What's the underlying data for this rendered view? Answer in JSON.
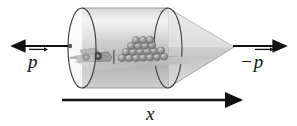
{
  "figure": {
    "background_color": "#ffffff",
    "width": 297,
    "height": 126
  },
  "labels": {
    "momentum_left": "p",
    "momentum_right_sign": "−",
    "momentum_right": "p",
    "axis_x": "x"
  },
  "arrows": {
    "left_momentum": {
      "name": "left-momentum-arrow",
      "direction": "left",
      "x_start": 70,
      "x_end": 8,
      "y": 46,
      "color": "#111111"
    },
    "right_momentum": {
      "name": "right-momentum-arrow",
      "direction": "right",
      "x_start": 232,
      "x_end": 290,
      "y": 46,
      "color": "#111111"
    },
    "x_axis": {
      "name": "x-axis-arrow",
      "direction": "right",
      "x_start": 62,
      "x_end": 246,
      "y": 100,
      "color": "#111111"
    }
  },
  "scene": {
    "cylinder": {
      "name": "cylinder-body",
      "left_center_x": 82,
      "right_center_x": 168,
      "center_y": 48,
      "radius_y": 40,
      "radius_x": 14,
      "fill_light": "#f2f2f2",
      "fill_mid": "#d0d0d0",
      "fill_dark": "#a8a8a8",
      "stroke": "#4a4a4a"
    },
    "cone": {
      "name": "cone-body",
      "base_x": 168,
      "tip_x": 234,
      "center_y": 48,
      "fill_light": "#efefef",
      "fill_dark": "#c4c4c4",
      "stroke": "#6d6d6d"
    },
    "ground_plane": {
      "name": "ground-plane",
      "fill": "#bdbdbd"
    },
    "cart": {
      "name": "cart-object",
      "x": 74,
      "y": 44,
      "width": 36,
      "height": 16,
      "body_color": "#8c8c8c",
      "wheel_color": "#4d4d4d"
    },
    "sphere_pile": {
      "name": "sphere-pile",
      "x": 118,
      "y": 40,
      "rows": [
        {
          "count": 9,
          "y": 57,
          "r": 3.6
        },
        {
          "count": 8,
          "y": 50,
          "r": 3.6
        },
        {
          "count": 6,
          "y": 44,
          "r": 3.6
        },
        {
          "count": 4,
          "y": 38,
          "r": 3.6
        }
      ],
      "color": "#8f8f8f",
      "highlight": "#c9c9c9",
      "stroke": "#5a5a5a"
    },
    "post": {
      "name": "vertical-post",
      "x": 113,
      "y_top": 50,
      "y_bottom": 64,
      "color": "#6b6b6b"
    }
  }
}
